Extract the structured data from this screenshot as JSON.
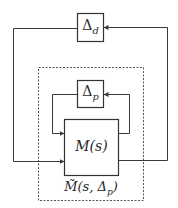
{
  "diagram": {
    "type": "block-diagram-feedback",
    "blocks": {
      "delta_d": {
        "symbol": "Δ",
        "sub": "d"
      },
      "delta_p": {
        "symbol": "Δ",
        "sub": "p"
      },
      "plant": {
        "label": "M(s)"
      },
      "augmented": {
        "label_main": "M̃(s, Δ",
        "label_sub": "p",
        "label_end": ")"
      }
    },
    "colors": {
      "line": "#3a3a3a",
      "dashed": "#555555",
      "background": "#ffffff"
    }
  }
}
